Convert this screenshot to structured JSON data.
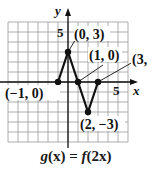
{
  "chart_data": {
    "type": "line",
    "title": "g(x) = f(2x)",
    "xlabel": "x",
    "ylabel": "y",
    "xlim": [
      -6,
      6
    ],
    "ylim": [
      -6,
      6
    ],
    "grid": true,
    "tick_labels": {
      "x": [
        "5"
      ],
      "y": [
        "5"
      ]
    },
    "series": [
      {
        "name": "g(x)",
        "points": [
          [
            -1,
            0
          ],
          [
            0,
            3
          ],
          [
            1,
            0
          ],
          [
            2,
            -3
          ],
          [
            3,
            0
          ]
        ]
      }
    ],
    "annotations": [
      {
        "text": "(−1, 0)",
        "point": [
          -1,
          0
        ]
      },
      {
        "text": "(0, 3)",
        "point": [
          0,
          3
        ]
      },
      {
        "text": "(1, 0)",
        "point": [
          1,
          0
        ]
      },
      {
        "text": "(2, −3)",
        "point": [
          2,
          -3
        ]
      },
      {
        "text": "(3,",
        "point": [
          3,
          0
        ]
      }
    ]
  },
  "labels": {
    "x_axis": "x",
    "y_axis": "y",
    "x_tick": "5",
    "y_tick": "5",
    "p1": "(−1, 0)",
    "p2": "(0, 3)",
    "p3": "(1, 0)",
    "p4": "(2, −3)",
    "p5": "(3,"
  },
  "caption": {
    "g": "g",
    "x1": "(x)",
    "eq": " = ",
    "f": "f",
    "arg": "(2x)"
  },
  "colors": {
    "grid": "#9a9a9a",
    "axis": "#111111",
    "curve": "#111111"
  }
}
